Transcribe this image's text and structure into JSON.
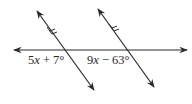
{
  "diagram": {
    "type": "parallel-lines-cut-by-transversal",
    "colors": {
      "line": "#2a2a2a",
      "background": "#ffffff"
    },
    "lines": {
      "horizontal": {
        "x1": 12,
        "y1": 50,
        "x2": 189,
        "y2": 50,
        "arrows": "both"
      },
      "transversal_left": {
        "x1": 36,
        "y1": 9,
        "x2": 95,
        "y2": 92,
        "arrows": "both",
        "parallel_marks": 2
      },
      "transversal_right": {
        "x1": 97,
        "y1": 7,
        "x2": 155,
        "y2": 89,
        "arrows": "both",
        "parallel_marks": 2
      }
    },
    "labels": {
      "left_angle": {
        "coef": "5",
        "var": "x",
        "rest": " + 7°",
        "full": "5x + 7°"
      },
      "right_angle": {
        "coef": "9",
        "var": "x",
        "rest": " − 63°",
        "full": "9x − 63°"
      }
    }
  }
}
